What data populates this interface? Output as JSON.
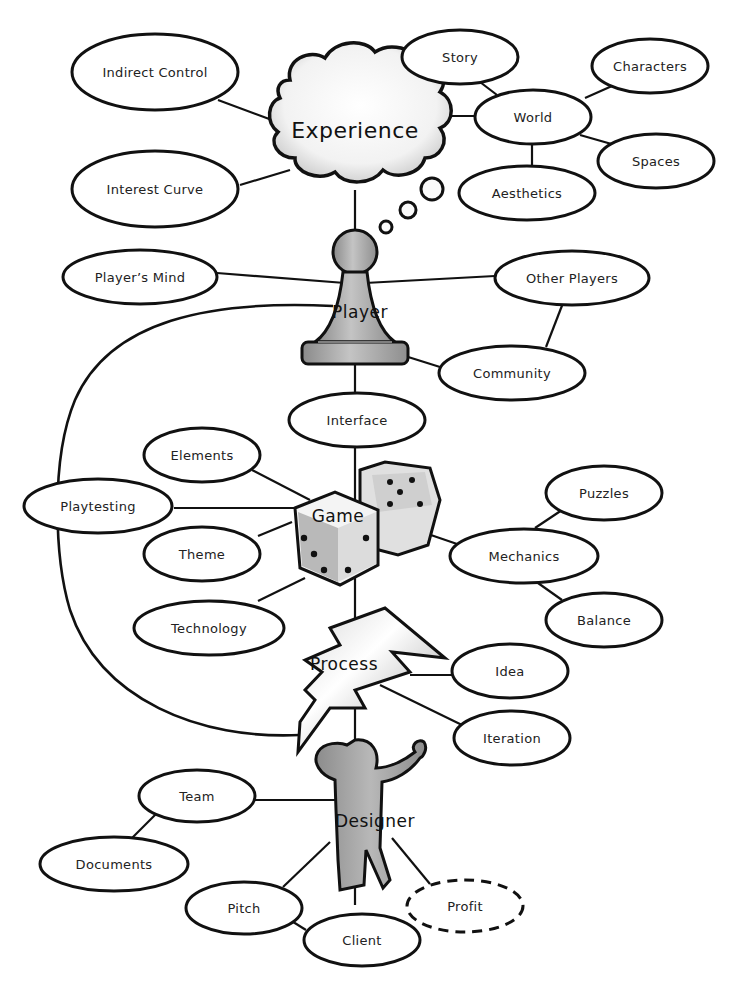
{
  "colors": {
    "stroke": "#111111",
    "fill": "#ffffff",
    "figure": "#a8a8a8",
    "text": "#222222"
  },
  "hubs": {
    "experience": "Experience",
    "player": "Player",
    "game": "Game",
    "process": "Process",
    "designer": "Designer"
  },
  "nodes": {
    "indirect_control": "Indirect Control",
    "interest_curve": "Interest Curve",
    "story": "Story",
    "world": "World",
    "characters": "Characters",
    "spaces": "Spaces",
    "aesthetics": "Aesthetics",
    "players_mind": "Player’s Mind",
    "other_players": "Other Players",
    "community": "Community",
    "interface": "Interface",
    "elements": "Elements",
    "playtesting": "Playtesting",
    "theme": "Theme",
    "technology": "Technology",
    "puzzles": "Puzzles",
    "mechanics": "Mechanics",
    "balance": "Balance",
    "idea": "Idea",
    "iteration": "Iteration",
    "team": "Team",
    "documents": "Documents",
    "pitch": "Pitch",
    "client": "Client",
    "profit": "Profit"
  }
}
